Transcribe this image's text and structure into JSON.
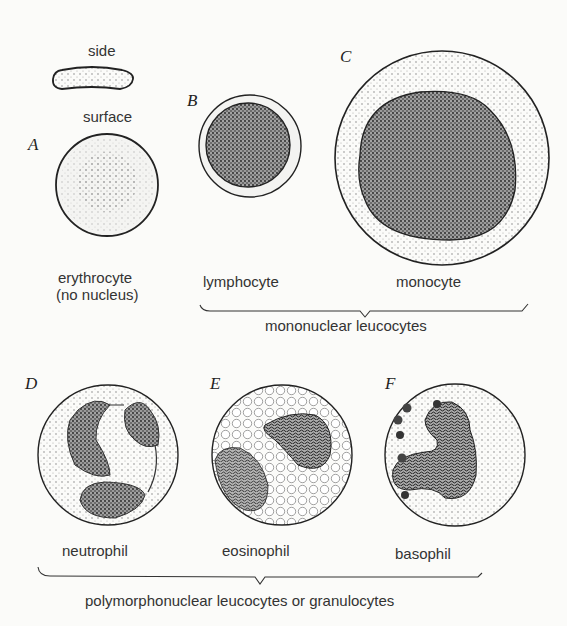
{
  "figure": {
    "panels": [
      {
        "letter": "A",
        "name": "erythrocyte",
        "labels": {
          "side": "side",
          "surface": "surface",
          "caption_1": "erythrocyte",
          "caption_2": "(no nucleus)"
        }
      },
      {
        "letter": "B",
        "name": "lymphocyte",
        "caption": "lymphocyte"
      },
      {
        "letter": "C",
        "name": "monocyte",
        "caption": "monocyte"
      },
      {
        "letter": "D",
        "name": "neutrophil",
        "caption": "neutrophil"
      },
      {
        "letter": "E",
        "name": "eosinophil",
        "caption": "eosinophil"
      },
      {
        "letter": "F",
        "name": "basophil",
        "caption": "basophil"
      }
    ],
    "groups": {
      "mononuclear": "mononuclear leucocytes",
      "polymorphonuclear": "polymorphonuclear leucocytes or granulocytes"
    }
  }
}
